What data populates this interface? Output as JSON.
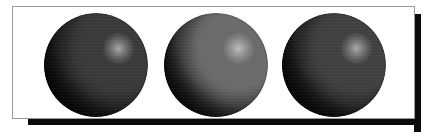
{
  "figure": {
    "caption": "",
    "background_color": "#ffffff",
    "panel": {
      "fill_color": "#ffffff",
      "border_color": "#9a9a9a",
      "border_width_px": 1,
      "x": 12,
      "y": 6,
      "width": 403,
      "height": 113
    },
    "drop_shadow": {
      "color": "#0b0b0b",
      "thickness_px": 7,
      "offset_x_px": 6,
      "offset_y_px": 6
    },
    "light": {
      "direction": "upper-right",
      "highlight_position": "72% 34%",
      "shadow_side": "lower-left"
    },
    "spheres": [
      {
        "id": "sphere-1",
        "label": "Left sphere",
        "shading": "low ambient, dark diffuse",
        "base_color": "#3a3a3a",
        "highlight_color": "#b9b9b9",
        "shadow_color": "#121212",
        "center_x": 96,
        "center_y": 65,
        "radius": 52,
        "highlight_x_pct": 72,
        "highlight_y_pct": 34
      },
      {
        "id": "sphere-2",
        "label": "Center sphere",
        "shading": "medium ambient, mid diffuse",
        "base_color": "#6a6a6a",
        "highlight_color": "#d8d8d8",
        "shadow_color": "#171717",
        "center_x": 216,
        "center_y": 65,
        "radius": 52,
        "highlight_x_pct": 72,
        "highlight_y_pct": 34
      },
      {
        "id": "sphere-3",
        "label": "Right sphere",
        "shading": "low ambient, dark diffuse",
        "base_color": "#404040",
        "highlight_color": "#c2c2c2",
        "shadow_color": "#131313",
        "center_x": 334,
        "center_y": 65,
        "radius": 52,
        "highlight_x_pct": 72,
        "highlight_y_pct": 34
      }
    ]
  }
}
